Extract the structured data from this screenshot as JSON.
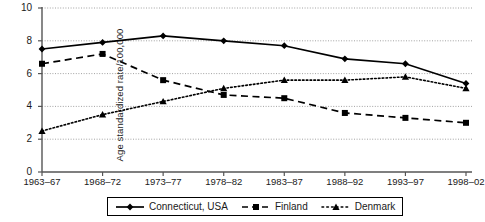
{
  "chart_data": {
    "type": "line",
    "title": "",
    "xlabel": "",
    "ylabel": "Age standardized rate/100,000",
    "categories": [
      "1963–67",
      "1968–72",
      "1973–77",
      "1978–82",
      "1983–87",
      "1988–92",
      "1993–97",
      "1998–02"
    ],
    "ylim": [
      0,
      10
    ],
    "yticks": [
      0,
      2,
      4,
      6,
      8,
      10
    ],
    "grid": "horizontal-dotted",
    "legend_position": "bottom-center",
    "series": [
      {
        "name": "Connecticut, USA",
        "marker": "diamond",
        "line_style": "solid",
        "color": "#000000",
        "values": [
          7.5,
          7.9,
          8.3,
          8.0,
          7.7,
          6.9,
          6.6,
          5.4
        ]
      },
      {
        "name": "Finland",
        "marker": "square",
        "line_style": "dashed",
        "color": "#000000",
        "values": [
          6.6,
          7.2,
          5.6,
          4.7,
          4.5,
          3.6,
          3.3,
          3.0
        ]
      },
      {
        "name": "Denmark",
        "marker": "triangle",
        "line_style": "dotted",
        "color": "#000000",
        "values": [
          2.5,
          3.5,
          4.3,
          5.1,
          5.6,
          5.6,
          5.8,
          5.1
        ]
      }
    ]
  }
}
